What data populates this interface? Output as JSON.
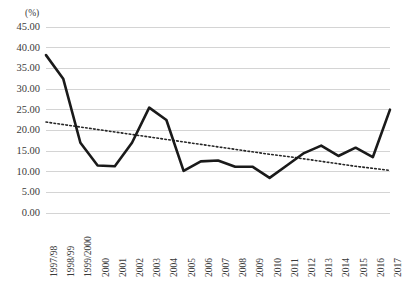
{
  "chart_data": {
    "type": "line",
    "title": "",
    "subtitle": "",
    "xlabel": "",
    "ylabel": "(%)",
    "y_unit_label": "(%)",
    "ylim": [
      0,
      45
    ],
    "ytick_step": 5,
    "ytick_labels": [
      "0.00",
      "5.00",
      "10.00",
      "15.00",
      "20.00",
      "25.00",
      "30.00",
      "35.00",
      "40.00",
      "45.00"
    ],
    "ytick_values": [
      0,
      5,
      10,
      15,
      20,
      25,
      30,
      35,
      40,
      45
    ],
    "grid": true,
    "grid_axis": "y",
    "legend": false,
    "legend_position": "none",
    "categories": [
      "1997/98",
      "1998/99",
      "1999/2000",
      "2000",
      "2001",
      "2002",
      "2003",
      "2004",
      "2005",
      "2006",
      "2007",
      "2008",
      "2009",
      "2010",
      "2011",
      "2012",
      "2013",
      "2014",
      "2015",
      "2016",
      "2017"
    ],
    "series": [
      {
        "name": "value",
        "style": "solid",
        "color": "#1a1a1a",
        "width": 2.6,
        "values": [
          38.2,
          32.5,
          17.0,
          11.5,
          11.3,
          17.0,
          25.5,
          22.5,
          10.2,
          12.5,
          12.7,
          11.2,
          11.2,
          8.5,
          11.5,
          14.5,
          16.3,
          13.8,
          15.8,
          13.5,
          25.0
        ]
      },
      {
        "name": "trend",
        "style": "dotted",
        "color": "#262626",
        "width": 1.6,
        "values": [
          22.0,
          21.4,
          20.8,
          20.2,
          19.6,
          19.0,
          18.4,
          17.8,
          17.2,
          16.6,
          16.0,
          15.4,
          14.8,
          14.2,
          13.7,
          13.1,
          12.5,
          11.9,
          11.3,
          10.8,
          10.3
        ]
      }
    ],
    "annotations": []
  },
  "colors": {
    "series_line": "#1a1a1a",
    "trend_line": "#262626",
    "gridline": "#d4d4d4",
    "text": "#3b3b3b",
    "background": "#ffffff"
  }
}
